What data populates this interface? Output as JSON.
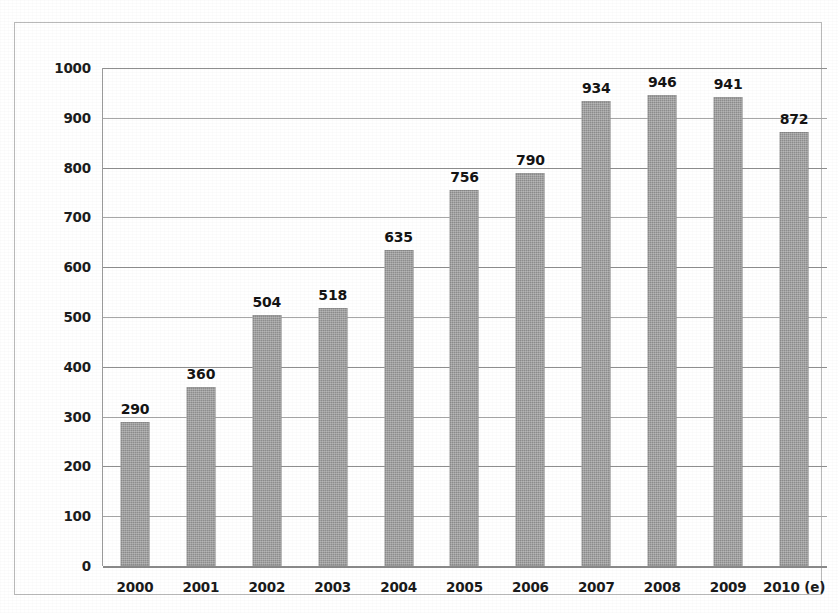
{
  "chart_data": {
    "type": "bar",
    "title": "",
    "subtitle": "",
    "xlabel": "",
    "ylabel": "",
    "categories": [
      "2000",
      "2001",
      "2002",
      "2003",
      "2004",
      "2005",
      "2006",
      "2007",
      "2008",
      "2009",
      "2010 (e)"
    ],
    "values": [
      290,
      360,
      504,
      518,
      635,
      756,
      790,
      934,
      946,
      941,
      872
    ],
    "data_labels": [
      "290",
      "360",
      "504",
      "518",
      "635",
      "756",
      "790",
      "934",
      "946",
      "941",
      "872"
    ],
    "ylim": [
      0,
      1000
    ],
    "ytick_step": 100,
    "ytick_labels": [
      "1000",
      "900",
      "800",
      "700",
      "600",
      "500",
      "400",
      "300",
      "200",
      "100",
      "0"
    ],
    "ytick_values": [
      1000,
      900,
      800,
      700,
      600,
      500,
      400,
      300,
      200,
      100,
      0
    ],
    "grid": true,
    "grid_axis": "y",
    "legend": false,
    "legend_position": "none",
    "series": [
      {
        "name": "",
        "values": [
          290,
          360,
          504,
          518,
          635,
          756,
          790,
          934,
          946,
          941,
          872
        ]
      }
    ],
    "colors": {
      "bar_fill": "#8d8d8d",
      "gridline": "#a7a7a7",
      "axis": "#8a8a8a",
      "border": "#b9b9b9",
      "text": "#1a1a1a",
      "background": "#ffffff"
    }
  }
}
